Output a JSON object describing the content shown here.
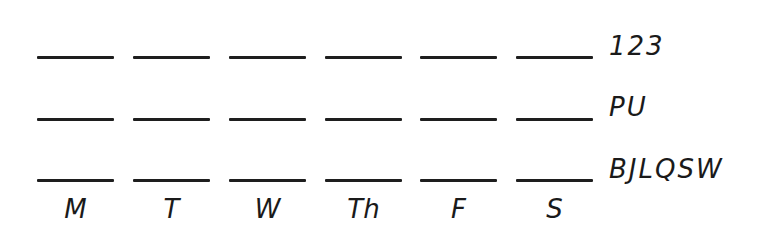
{
  "worksheet": {
    "rows": [
      {
        "label": "123",
        "line_y": 56
      },
      {
        "label": "PU",
        "line_y": 118
      },
      {
        "label": "BJLQSW",
        "line_y": 179
      }
    ],
    "columns": [
      {
        "day": "M",
        "x": 37
      },
      {
        "day": "T",
        "x": 133
      },
      {
        "day": "W",
        "x": 229
      },
      {
        "day": "Th",
        "x": 325
      },
      {
        "day": "F",
        "x": 420
      },
      {
        "day": "S",
        "x": 516
      }
    ],
    "line_color": "#1e1e1e",
    "text_color": "#1a1a1a",
    "background": "#ffffff"
  }
}
